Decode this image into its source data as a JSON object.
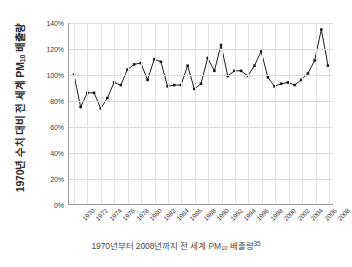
{
  "chart_data": {
    "type": "line",
    "title": "",
    "xlabel": "",
    "ylabel": "1970년 수치 대비 전 세계 PM10 배출량",
    "ylabel_main": "1970년 수치 대비 전 세계 PM",
    "ylabel_sub": "10",
    "ylabel_tail": " 배출량",
    "caption_main": "1970년부터 2008년까지 전 세계 PM",
    "caption_sub": "10",
    "caption_tail": " 배출량",
    "caption_footnote": "35",
    "ylim": [
      0,
      140
    ],
    "ytick_values": [
      0,
      20,
      40,
      60,
      80,
      100,
      120,
      140
    ],
    "ytick_labels": [
      "0%",
      "20%",
      "40%",
      "60%",
      "80%",
      "100%",
      "120%",
      "140%"
    ],
    "xlim": [
      1970,
      2008
    ],
    "xtick_labels": [
      "1970",
      "1972",
      "1974",
      "1976",
      "1978",
      "1980",
      "1982",
      "1984",
      "1986",
      "1988",
      "1990",
      "1992",
      "1994",
      "1996",
      "1998",
      "2000",
      "2002",
      "2004",
      "2006",
      "2008"
    ],
    "grid": "both",
    "legend": "none",
    "line_color": "#1a1a1a",
    "marker_color": "#1a1a1a",
    "grid_color": "#d9d9d9",
    "axis_color": "#9a9a9a",
    "x": [
      1970,
      1971,
      1972,
      1973,
      1974,
      1975,
      1976,
      1977,
      1978,
      1979,
      1980,
      1981,
      1982,
      1983,
      1984,
      1985,
      1986,
      1987,
      1988,
      1989,
      1990,
      1991,
      1992,
      1993,
      1994,
      1995,
      1996,
      1997,
      1998,
      1999,
      2000,
      2001,
      2002,
      2003,
      2004,
      2005,
      2006,
      2007,
      2008
    ],
    "values": [
      100,
      75,
      86,
      86,
      74,
      82,
      94,
      92,
      104,
      108,
      109,
      96,
      112,
      110,
      91,
      92,
      92,
      107,
      89,
      93,
      113,
      103,
      123,
      99,
      103,
      103,
      99,
      107,
      118,
      98,
      91,
      93,
      94,
      92,
      96,
      101,
      111,
      135,
      107
    ]
  }
}
